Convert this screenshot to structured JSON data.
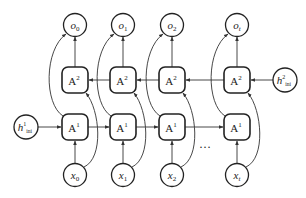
{
  "diagram": {
    "colors": {
      "stroke": "#222222",
      "edge": "#333333",
      "background": "#ffffff"
    },
    "outputs": [
      {
        "base": "o",
        "sub": "0"
      },
      {
        "base": "o",
        "sub": "1"
      },
      {
        "base": "o",
        "sub": "2"
      },
      {
        "base": "o",
        "sub": "t"
      }
    ],
    "layer2_cells": [
      {
        "base": "A",
        "sup": "2"
      },
      {
        "base": "A",
        "sup": "2"
      },
      {
        "base": "A",
        "sup": "2"
      },
      {
        "base": "A",
        "sup": "2"
      }
    ],
    "layer1_cells": [
      {
        "base": "A",
        "sup": "1"
      },
      {
        "base": "A",
        "sup": "1"
      },
      {
        "base": "A",
        "sup": "1"
      },
      {
        "base": "A",
        "sup": "1"
      }
    ],
    "inputs": [
      {
        "base": "x",
        "sub": "0"
      },
      {
        "base": "x",
        "sub": "1"
      },
      {
        "base": "x",
        "sub": "2"
      },
      {
        "base": "x",
        "sub": "t"
      }
    ],
    "init_states": {
      "layer1": {
        "base": "h",
        "sup": "1",
        "sub": "ini"
      },
      "layer2": {
        "base": "h",
        "sup": "2",
        "sub": "ini"
      }
    },
    "ellipsis": "…"
  }
}
